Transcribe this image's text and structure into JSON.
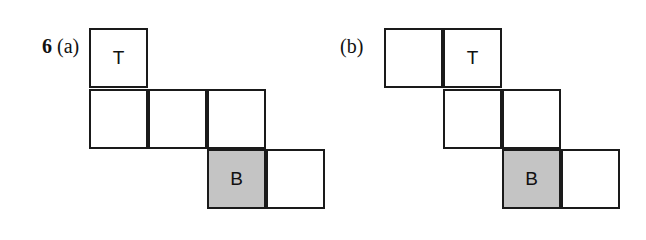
{
  "question": {
    "number": "6",
    "part_a_label": "(a)",
    "part_b_label": "(b)"
  },
  "net_a": {
    "squares": [
      {
        "col": 0,
        "row": 0,
        "text": "T",
        "shaded": false
      },
      {
        "col": 0,
        "row": 1,
        "text": "",
        "shaded": false
      },
      {
        "col": 1,
        "row": 1,
        "text": "",
        "shaded": false
      },
      {
        "col": 2,
        "row": 1,
        "text": "",
        "shaded": false
      },
      {
        "col": 2,
        "row": 2,
        "text": "B",
        "shaded": true
      },
      {
        "col": 3,
        "row": 2,
        "text": "",
        "shaded": false
      }
    ]
  },
  "net_b": {
    "squares": [
      {
        "col": 0,
        "row": 0,
        "text": "",
        "shaded": false
      },
      {
        "col": 1,
        "row": 0,
        "text": "T",
        "shaded": false
      },
      {
        "col": 1,
        "row": 1,
        "text": "",
        "shaded": false
      },
      {
        "col": 2,
        "row": 1,
        "text": "",
        "shaded": false
      },
      {
        "col": 2,
        "row": 2,
        "text": "B",
        "shaded": true
      },
      {
        "col": 3,
        "row": 2,
        "text": "",
        "shaded": false
      }
    ]
  },
  "colors": {
    "shade": "#c4c4c4",
    "stroke": "#1a1a1a"
  }
}
